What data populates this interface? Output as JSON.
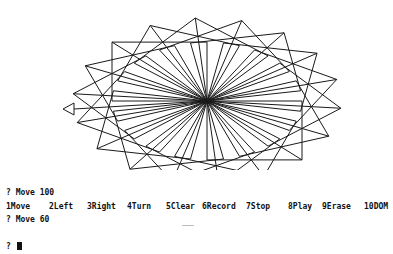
{
  "drawing": {
    "center": [
      207,
      101
    ],
    "square_count": 18,
    "square_side": 95,
    "rotation_step_deg": 20,
    "start_angle_deg": 0,
    "stroke_color": "#1a1a1a",
    "turtle": {
      "shape": "triangle-arrow",
      "tip": [
        63,
        109
      ],
      "heading": "left",
      "tail_line_to": [
        207,
        101
      ]
    }
  },
  "console": {
    "lines": [
      "? Move 100",
      "? Move 60",
      "? "
    ]
  },
  "function_keys": [
    {
      "num": "1",
      "label": "Move",
      "x": 0
    },
    {
      "num": "2",
      "label": "Left",
      "x": 43
    },
    {
      "num": "3",
      "label": "Right",
      "x": 81
    },
    {
      "num": "4",
      "label": "Turn",
      "x": 121
    },
    {
      "num": "5",
      "label": "Clear",
      "x": 160
    },
    {
      "num": "6",
      "label": "Record",
      "x": 196
    },
    {
      "num": "7",
      "label": "Stop",
      "x": 240
    },
    {
      "num": "8",
      "label": "Play",
      "x": 282
    },
    {
      "num": "9",
      "label": "Erase",
      "x": 316
    },
    {
      "num": "10",
      "label": "DOM",
      "x": 358
    }
  ]
}
